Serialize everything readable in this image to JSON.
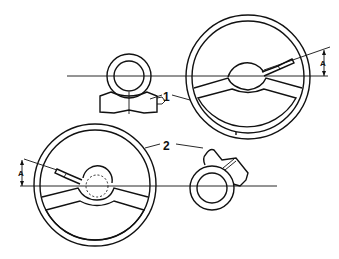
{
  "diagram": {
    "callouts": [
      {
        "id": "1",
        "label": "1"
      },
      {
        "id": "2",
        "label": "2"
      }
    ],
    "dimensions": [
      {
        "id": "upper",
        "label": "A"
      },
      {
        "id": "lower",
        "label": "A"
      }
    ],
    "colors": {
      "line": "#111111",
      "background": "#ffffff"
    }
  }
}
